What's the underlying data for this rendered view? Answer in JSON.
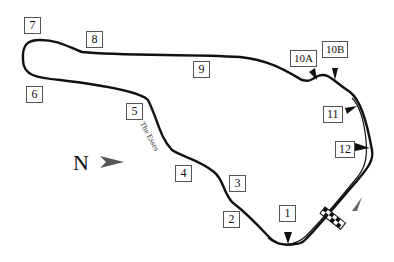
{
  "diagram": {
    "type": "race-track-map",
    "track_color": "#111111",
    "compass": {
      "label": "N",
      "arrow_color": "#555555"
    },
    "section_name": "The Esses",
    "turns": [
      {
        "id": "t1",
        "label": "1"
      },
      {
        "id": "t2",
        "label": "2"
      },
      {
        "id": "t3",
        "label": "3"
      },
      {
        "id": "t4",
        "label": "4"
      },
      {
        "id": "t5",
        "label": "5"
      },
      {
        "id": "t6",
        "label": "6"
      },
      {
        "id": "t7",
        "label": "7"
      },
      {
        "id": "t8",
        "label": "8"
      },
      {
        "id": "t9",
        "label": "9"
      },
      {
        "id": "t10a",
        "label": "10A"
      },
      {
        "id": "t10b",
        "label": "10B"
      },
      {
        "id": "t11",
        "label": "11"
      },
      {
        "id": "t12",
        "label": "12"
      }
    ],
    "start_finish": {
      "pattern": "checkered",
      "direction_arrow_color": "#666666"
    }
  }
}
